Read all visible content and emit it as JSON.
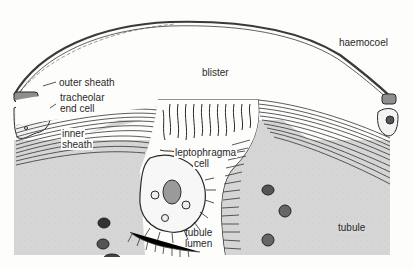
{
  "diagram": {
    "type": "biological-cross-section",
    "colors": {
      "background": "#fdfdfc",
      "tubule_fill": "#d3d3d3",
      "ink": "#2a2a2a",
      "muscle_fill": "#bdbdbd"
    },
    "labels": {
      "haemocoel": "haemocoel",
      "blister": "blister",
      "outer_sheath": "outer sheath",
      "tracheolar_end_cell_1": "tracheolar",
      "tracheolar_end_cell_2": "end cell",
      "inner_sheath_1": "inner",
      "inner_sheath_2": "sheath",
      "leptophragma_cell_1": "leptophragma",
      "leptophragma_cell_2": "cell",
      "tubule_lumen_1": "tubule",
      "tubule_lumen_2": "lumen",
      "tubule": "tubule"
    }
  }
}
